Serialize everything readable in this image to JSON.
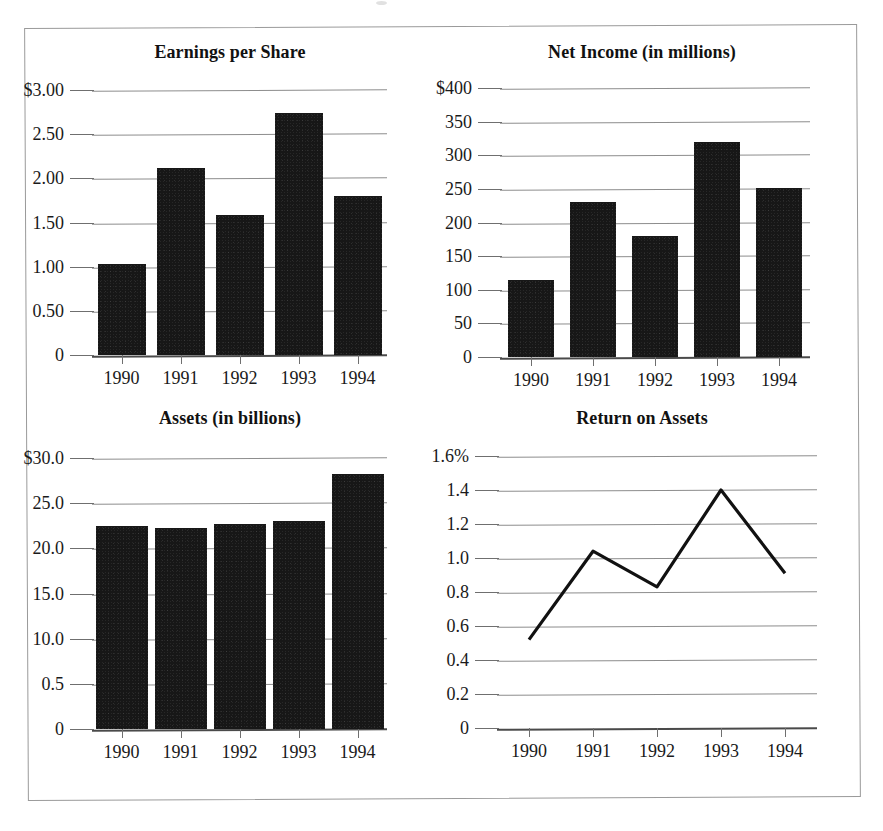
{
  "page": {
    "kind": "scanned-financial-report-figure",
    "border_color": "#9a9a9a",
    "bar_color": "#171717",
    "gridline_color": "#8d8d8d",
    "background": "#ffffff"
  },
  "charts": [
    {
      "id": "earnings-per-share",
      "title": "Earnings per Share",
      "type": "bar",
      "categories": [
        "1990",
        "1991",
        "1992",
        "1993",
        "1994"
      ],
      "values": [
        1.03,
        2.12,
        1.58,
        2.74,
        1.8
      ],
      "yticks": [
        "$3.00",
        "2.50",
        "2.00",
        "1.50",
        "1.00",
        "0.50",
        "0"
      ],
      "ytick_values": [
        3.0,
        2.5,
        2.0,
        1.5,
        1.0,
        0.5,
        0
      ],
      "ylim": [
        0,
        3.0
      ],
      "xlabel": "",
      "ylabel": ""
    },
    {
      "id": "net-income",
      "title": "Net Income (in millions)",
      "type": "bar",
      "categories": [
        "1990",
        "1991",
        "1992",
        "1993",
        "1994"
      ],
      "values": [
        115,
        230,
        180,
        320,
        252
      ],
      "yticks": [
        "$400",
        "350",
        "300",
        "250",
        "200",
        "150",
        "100",
        "50",
        "0"
      ],
      "ytick_values": [
        400,
        350,
        300,
        250,
        200,
        150,
        100,
        50,
        0
      ],
      "ylim": [
        0,
        400
      ],
      "xlabel": "",
      "ylabel": ""
    },
    {
      "id": "assets",
      "title": "Assets (in billions)",
      "type": "bar",
      "categories": [
        "1990",
        "1991",
        "1992",
        "1993",
        "1994"
      ],
      "values": [
        22.5,
        22.2,
        22.7,
        23.0,
        28.2
      ],
      "yticks": [
        "$30.0",
        "25.0",
        "20.0",
        "15.0",
        "10.0",
        "0.5",
        "0"
      ],
      "ytick_values": [
        30.0,
        25.0,
        20.0,
        15.0,
        10.0,
        5.0,
        0
      ],
      "ylim": [
        0,
        30.0
      ],
      "xlabel": "",
      "ylabel": ""
    },
    {
      "id": "return-on-assets",
      "title": "Return on Assets",
      "type": "line",
      "categories": [
        "1990",
        "1991",
        "1992",
        "1993",
        "1994"
      ],
      "values": [
        0.52,
        1.04,
        0.83,
        1.4,
        0.91
      ],
      "yticks": [
        "1.6%",
        "1.4",
        "1.2",
        "1.0",
        "0.8",
        "0.6",
        "0.4",
        "0.2",
        "0"
      ],
      "ytick_values": [
        1.6,
        1.4,
        1.2,
        1.0,
        0.8,
        0.6,
        0.4,
        0.2,
        0
      ],
      "ylim": [
        0,
        1.6
      ],
      "xlabel": "",
      "ylabel": ""
    }
  ],
  "chart_data": [
    {
      "type": "bar",
      "title": "Earnings per Share",
      "categories": [
        "1990",
        "1991",
        "1992",
        "1993",
        "1994"
      ],
      "values": [
        1.03,
        2.12,
        1.58,
        2.74,
        1.8
      ],
      "xlabel": "",
      "ylabel": "",
      "ylim": [
        0,
        3.0
      ],
      "yticklabels": [
        "$3.00",
        "2.50",
        "2.00",
        "1.50",
        "1.00",
        "0.50",
        "0"
      ],
      "grid": true,
      "legend": "none"
    },
    {
      "type": "bar",
      "title": "Net Income (in millions)",
      "categories": [
        "1990",
        "1991",
        "1992",
        "1993",
        "1994"
      ],
      "values": [
        115,
        230,
        180,
        320,
        252
      ],
      "xlabel": "",
      "ylabel": "",
      "ylim": [
        0,
        400
      ],
      "yticklabels": [
        "$400",
        "350",
        "300",
        "250",
        "200",
        "150",
        "100",
        "50",
        "0"
      ],
      "grid": true,
      "legend": "none"
    },
    {
      "type": "bar",
      "title": "Assets (in billions)",
      "categories": [
        "1990",
        "1991",
        "1992",
        "1993",
        "1994"
      ],
      "values": [
        22.5,
        22.2,
        22.7,
        23.0,
        28.2
      ],
      "xlabel": "",
      "ylabel": "",
      "ylim": [
        0,
        30.0
      ],
      "yticklabels": [
        "$30.0",
        "25.0",
        "20.0",
        "15.0",
        "10.0",
        "0.5",
        "0"
      ],
      "grid": true,
      "legend": "none"
    },
    {
      "type": "line",
      "title": "Return on Assets",
      "categories": [
        "1990",
        "1991",
        "1992",
        "1993",
        "1994"
      ],
      "values": [
        0.52,
        1.04,
        0.83,
        1.4,
        0.91
      ],
      "xlabel": "",
      "ylabel": "",
      "ylim": [
        0,
        1.6
      ],
      "yticklabels": [
        "1.6%",
        "1.4",
        "1.2",
        "1.0",
        "0.8",
        "0.6",
        "0.4",
        "0.2",
        "0"
      ],
      "grid": true,
      "legend": "none"
    }
  ]
}
